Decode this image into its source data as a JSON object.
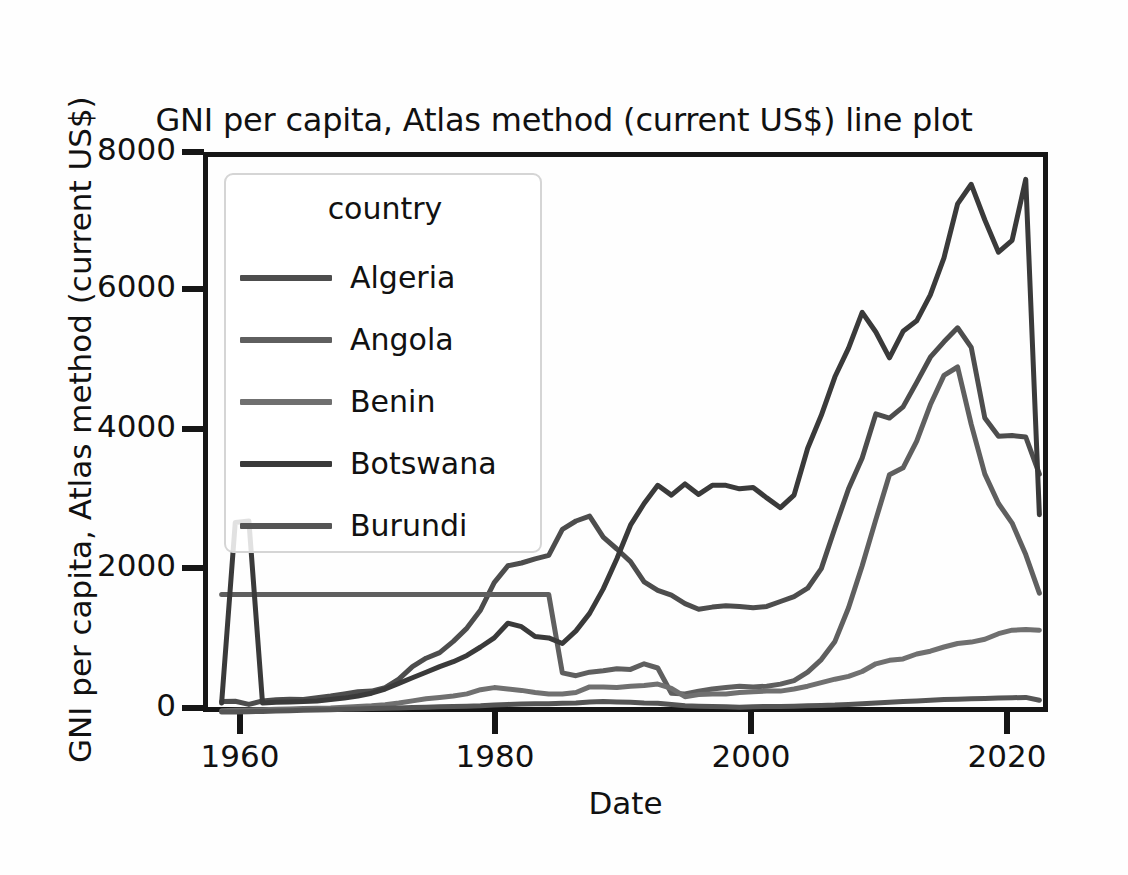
{
  "chart_data": {
    "type": "line",
    "title": "GNI per capita, Atlas method (current US$) line plot",
    "xlabel": "Date",
    "ylabel": "GNI per capita, Atlas method (current US$)",
    "legend_title": "country",
    "legend_position": "upper-left-inside",
    "grid": false,
    "xlim": [
      1959,
      2021
    ],
    "ylim": [
      0,
      8000
    ],
    "xticks": [
      "1960",
      "1980",
      "2000",
      "2020"
    ],
    "yticks": [
      "0",
      "2000",
      "4000",
      "6000",
      "8000"
    ],
    "xtick_values": [
      1960,
      1980,
      2000,
      2020
    ],
    "ytick_values": [
      0,
      2000,
      4000,
      6000,
      8000
    ],
    "x": [
      1960,
      1961,
      1962,
      1963,
      1964,
      1965,
      1966,
      1967,
      1968,
      1969,
      1970,
      1971,
      1972,
      1973,
      1974,
      1975,
      1976,
      1977,
      1978,
      1979,
      1980,
      1981,
      1982,
      1983,
      1984,
      1985,
      1986,
      1987,
      1988,
      1989,
      1990,
      1991,
      1992,
      1993,
      1994,
      1995,
      1996,
      1997,
      1998,
      1999,
      2000,
      2001,
      2002,
      2003,
      2004,
      2005,
      2006,
      2007,
      2008,
      2009,
      2010,
      2011,
      2012,
      2013,
      2014,
      2015,
      2016,
      2017,
      2018,
      2019,
      2020
    ],
    "series": [
      {
        "name": "Algeria",
        "color": "#4d4d4d",
        "values": [
          220,
          225,
          180,
          230,
          245,
          255,
          250,
          275,
          300,
          330,
          360,
          370,
          420,
          540,
          720,
          840,
          920,
          1080,
          1270,
          1530,
          1920,
          2160,
          2200,
          2260,
          2310,
          2680,
          2800,
          2870,
          2570,
          2400,
          2220,
          1930,
          1810,
          1740,
          1620,
          1540,
          1570,
          1590,
          1580,
          1560,
          1580,
          1650,
          1720,
          1840,
          2120,
          2700,
          3260,
          3700,
          4330,
          4270,
          4430,
          4780,
          5140,
          5360,
          5560,
          5280,
          4270,
          4010,
          4020,
          4000,
          3470
        ]
      },
      {
        "name": "Angola",
        "color": "#5f5f5f",
        "values": [
          1750,
          1750,
          1750,
          1750,
          1750,
          1750,
          1750,
          1750,
          1750,
          1750,
          1750,
          1750,
          1750,
          1750,
          1750,
          1750,
          1750,
          1750,
          1750,
          1750,
          1750,
          1750,
          1750,
          1750,
          1750,
          630,
          590,
          640,
          660,
          690,
          680,
          760,
          700,
          340,
          330,
          370,
          400,
          420,
          440,
          430,
          440,
          470,
          520,
          640,
          820,
          1080,
          1560,
          2160,
          2820,
          3460,
          3560,
          3940,
          4460,
          4880,
          5000,
          4180,
          3470,
          3050,
          2770,
          2320,
          1770
        ]
      },
      {
        "name": "Benin",
        "color": "#707070",
        "values": [
          90,
          95,
          100,
          105,
          110,
          115,
          120,
          125,
          130,
          140,
          150,
          160,
          175,
          200,
          230,
          260,
          280,
          300,
          330,
          390,
          420,
          400,
          380,
          350,
          330,
          330,
          350,
          430,
          430,
          420,
          440,
          450,
          470,
          410,
          290,
          320,
          330,
          330,
          350,
          360,
          370,
          370,
          400,
          440,
          490,
          540,
          580,
          650,
          760,
          810,
          830,
          900,
          940,
          1000,
          1050,
          1070,
          1110,
          1190,
          1240,
          1250,
          1240
        ]
      },
      {
        "name": "Botswana",
        "color": "#3a3a3a",
        "values": [
          200,
          2780,
          2800,
          200,
          210,
          215,
          220,
          230,
          250,
          270,
          300,
          340,
          400,
          480,
          560,
          640,
          720,
          790,
          880,
          1000,
          1130,
          1340,
          1290,
          1150,
          1130,
          1050,
          1230,
          1480,
          1830,
          2260,
          2740,
          3050,
          3310,
          3170,
          3330,
          3180,
          3310,
          3310,
          3260,
          3280,
          3130,
          2990,
          3170,
          3840,
          4310,
          4860,
          5270,
          5780,
          5500,
          5130,
          5510,
          5660,
          6030,
          6560,
          7330,
          7610,
          7100,
          6640,
          6810,
          7680,
          2890
        ]
      },
      {
        "name": "Burundi",
        "color": "#555555",
        "values": [
          70,
          70,
          75,
          80,
          85,
          90,
          95,
          100,
          105,
          110,
          115,
          120,
          125,
          130,
          135,
          140,
          145,
          150,
          155,
          160,
          170,
          180,
          185,
          190,
          190,
          195,
          200,
          215,
          220,
          215,
          210,
          200,
          195,
          180,
          160,
          155,
          150,
          145,
          140,
          145,
          150,
          150,
          155,
          160,
          165,
          170,
          180,
          190,
          200,
          210,
          220,
          230,
          240,
          250,
          255,
          260,
          265,
          270,
          275,
          280,
          240
        ]
      }
    ]
  }
}
